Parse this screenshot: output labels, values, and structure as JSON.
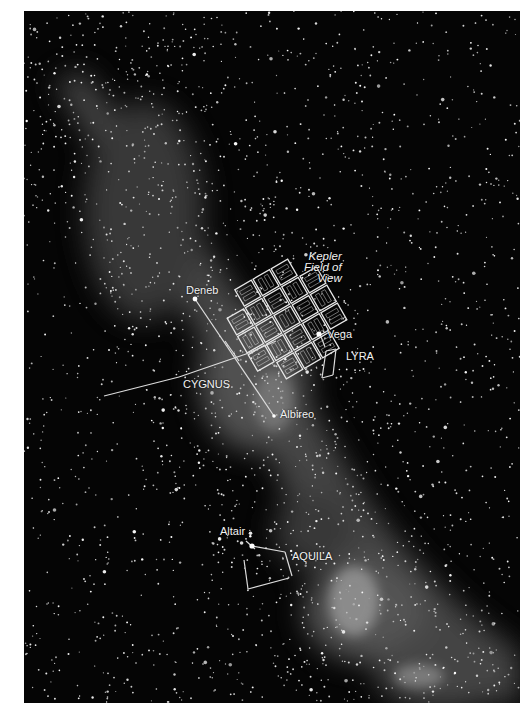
{
  "image": {
    "description": "Night-sky photograph of the Milky Way around Cygnus, Lyra and Aquila with the Kepler spacecraft field of view overlaid",
    "labels": {
      "kepler_fov": [
        "Kepler",
        "Field of",
        "View"
      ],
      "deneb": "Deneb",
      "vega": "Vega",
      "lyra": "LYRA",
      "cygnus": "CYGNUS",
      "albireo": "Albireo",
      "altair": "Altair",
      "aquila": "AQUILA"
    },
    "colors": {
      "sky": "#050505",
      "overlay_lines": "#e8e8e8",
      "page_background": "#ffffff"
    },
    "kepler_grid": {
      "modules": 21,
      "layout": "5x5 minus 4 corners",
      "rotation_deg": 30
    }
  }
}
